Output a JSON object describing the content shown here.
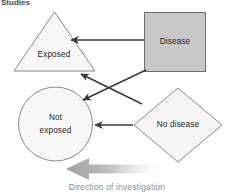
{
  "heading": {
    "text": "Studies"
  },
  "nodes": {
    "exposed": {
      "label": "Exposed",
      "shape": "triangle",
      "fill": "#f7f7f7",
      "stroke": "#8a8a8a"
    },
    "disease": {
      "label": "Disease",
      "shape": "square",
      "fill": "#c8c8c8",
      "stroke": "#6f6f6f"
    },
    "not_exposed": {
      "label_line1": "Not",
      "label_line2": "exposed",
      "shape": "circle",
      "fill": "#f7f7f7",
      "stroke": "#8a8a8a"
    },
    "no_disease": {
      "label": "No disease",
      "shape": "diamond",
      "fill": "#f5f5f5",
      "stroke": "#8a8a8a"
    }
  },
  "connectors": [
    {
      "name": "disease-to-exposed",
      "from": "disease",
      "to": "exposed"
    },
    {
      "name": "disease-to-not-exposed",
      "from": "disease",
      "to": "not_exposed"
    },
    {
      "name": "no-disease-to-exposed",
      "from": "no_disease",
      "to": "exposed"
    },
    {
      "name": "no-disease-to-not-exposed",
      "from": "no_disease",
      "to": "not_exposed"
    }
  ],
  "direction": {
    "caption": "Direction of investigation",
    "arrow_color_dark": "#9e9e9e",
    "arrow_color_light": "#ffffff",
    "points": "left"
  },
  "colors": {
    "background": "#ffffff",
    "line": "#3a3a3a",
    "caption_text": "#8d8d8d",
    "node_text": "#231f20"
  }
}
